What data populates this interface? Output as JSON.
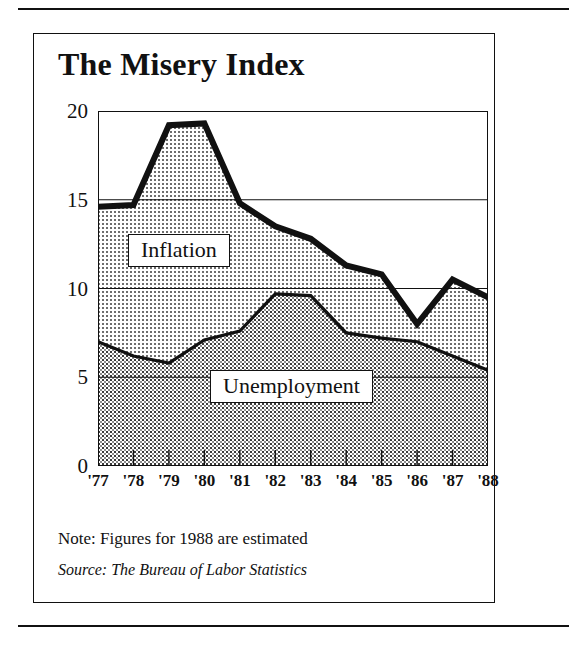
{
  "chart_data": {
    "type": "area",
    "title": "The Misery Index",
    "xlabel": "",
    "ylabel": "",
    "ylim": [
      0,
      20
    ],
    "yticks": [
      0,
      5,
      10,
      15,
      20
    ],
    "grid": true,
    "legend_position": "inline-callout",
    "categories": [
      "'77",
      "'78",
      "'79",
      "'80",
      "'81",
      "'82",
      "'83",
      "'84",
      "'85",
      "'86",
      "'87",
      "'88"
    ],
    "x_values": [
      1977,
      1978,
      1979,
      1980,
      1981,
      1982,
      1983,
      1984,
      1985,
      1986,
      1987,
      1988
    ],
    "series": [
      {
        "name": "Unemployment",
        "values": [
          7.0,
          6.2,
          5.8,
          7.1,
          7.6,
          9.7,
          9.6,
          7.5,
          7.2,
          7.0,
          6.2,
          5.4
        ],
        "fill": "dotted-dark",
        "stacked_order": 1
      },
      {
        "name": "Inflation",
        "values": [
          7.6,
          8.5,
          13.4,
          12.2,
          7.2,
          3.8,
          3.2,
          3.8,
          3.6,
          1.0,
          4.3,
          4.1
        ],
        "fill": "dotted-light",
        "stacked_order": 2
      }
    ],
    "total_line": {
      "name": "Misery Index",
      "values": [
        14.6,
        14.7,
        19.2,
        19.3,
        14.8,
        13.5,
        12.8,
        11.3,
        10.8,
        8.0,
        10.5,
        9.5
      ],
      "style": "thick-black"
    },
    "annotations": [
      {
        "label": "Inflation"
      },
      {
        "label": "Unemployment"
      }
    ]
  },
  "header": {
    "title": "The Misery Index"
  },
  "axes": {
    "y_tick_labels": [
      "20",
      "15",
      "10",
      "5",
      "0"
    ],
    "x_tick_labels": [
      "'77",
      "'78",
      "'79",
      "'80",
      "'81",
      "'82",
      "'83",
      "'84",
      "'85",
      "'86",
      "'87",
      "'88"
    ]
  },
  "labels": {
    "inflation": "Inflation",
    "unemployment": "Unemployment"
  },
  "footer": {
    "note": "Note: Figures for 1988 are estimated",
    "source": "Source: The Bureau of Labor Statistics"
  },
  "colors": {
    "ink": "#111111",
    "paper": "#ffffff",
    "unemployment_fill": "#b4b4b4",
    "inflation_fill": "#d8d8d8"
  }
}
